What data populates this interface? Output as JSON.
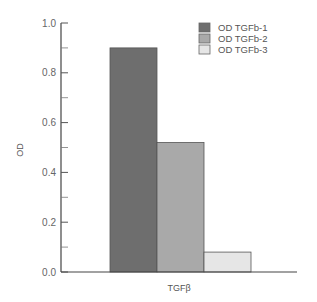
{
  "chart_data": {
    "type": "bar",
    "title": "",
    "xlabel": "TGFβ",
    "ylabel": "OD",
    "categories": [
      "TGFβ"
    ],
    "series": [
      {
        "name": "OD TGFb-1",
        "values": [
          0.9
        ],
        "color": "#6e6e6e"
      },
      {
        "name": "OD TGFb-2",
        "values": [
          0.52
        ],
        "color": "#a9a9a9"
      },
      {
        "name": "OD TGFb-3",
        "values": [
          0.08
        ],
        "color": "#e6e6e6"
      }
    ],
    "ylim": [
      0.0,
      1.0
    ],
    "yticks": [
      "0.0",
      "0.2",
      "0.4",
      "0.6",
      "0.8",
      "1.0"
    ],
    "minor_ticks": [
      0.1,
      0.3,
      0.5,
      0.7,
      0.9
    ],
    "grid": false,
    "legend_position": "upper right"
  }
}
